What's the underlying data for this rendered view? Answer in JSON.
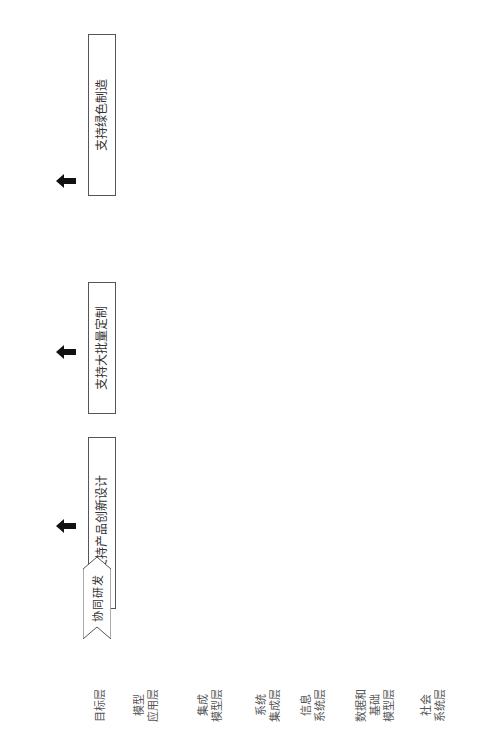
{
  "layers": [
    {
      "id": "goal",
      "label": "目标层"
    },
    {
      "id": "model-app",
      "label": "模型\n应用层"
    },
    {
      "id": "integration-model",
      "label": "集成\n模型层"
    },
    {
      "id": "system-integration",
      "label": "系统\n集成层"
    },
    {
      "id": "info-system",
      "label": "信息\n系统层"
    },
    {
      "id": "data-base-model",
      "label": "数据和\n基础\n模型层"
    },
    {
      "id": "social-system",
      "label": "社会\n系统层"
    }
  ],
  "goals": [
    {
      "label": "支持产品创新设计"
    },
    {
      "label": "支持大批量定制"
    },
    {
      "label": "支持绿色制造"
    }
  ],
  "applications": [
    {
      "label": "协同研发"
    },
    {
      "label": "协同设计"
    },
    {
      "label": "绿色采购"
    },
    {
      "label": "快速制造"
    },
    {
      "label": "快速装配"
    },
    {
      "label": "个性化配置"
    },
    {
      "label": "产品服务"
    },
    {
      "label": "产品回收"
    }
  ],
  "integration_models": {
    "product_model_label": "产品模型",
    "network_lines": [
      "互联网",
      "无线网",
      "物联网"
    ],
    "process_model_label": "过程模型"
  },
  "system_integration": {
    "text": "产品生命周期管理(PLM)系统；云制造平台；零件库平台；CAD/CAE/CAPP/CAM一体化集成系统"
  },
  "info_systems": [
    {
      "label": "PDM"
    },
    {
      "label": "CAD"
    },
    {
      "label": "CAE"
    },
    {
      "label": "CAM"
    },
    {
      "label": "ERP"
    },
    {
      "label": "MES"
    },
    {
      "label": "SCM"
    },
    {
      "label": "CRM"
    },
    {
      "label": "协同设计"
    },
    {
      "label": "协同管理"
    }
  ],
  "databases": [
    {
      "line1": "产品",
      "line2": "数据库"
    },
    {
      "line1": "产品",
      "line2": "模块库"
    },
    {
      "line1": "企业",
      "line2": "知识库"
    },
    {
      "line1": "软件",
      "line2": "组件库"
    },
    {
      "line1": "",
      "line2": "标准库"
    },
    {
      "line1": "客户",
      "line2": "数据库"
    },
    {
      "line1": "员工",
      "line2": "能力库"
    },
    {
      "line1": "环境",
      "line2": "数据库"
    },
    {
      "line1": "成本",
      "line2": "数据库"
    },
    {
      "line1": "计划",
      "line2": "数据库"
    },
    {
      "line1": "生产",
      "line2": "数据库"
    },
    {
      "line1": "供应商",
      "line2": "数据库"
    },
    {
      "line1": "服务",
      "line2": "数据库"
    }
  ],
  "social_system": {
    "text": "模型协同建立机制；知识共享激励机制；标准协同建立机制；节能减排机制；知识产权协同管理机制等"
  },
  "caption": "图 9-19　MBE 的体系结构"
}
